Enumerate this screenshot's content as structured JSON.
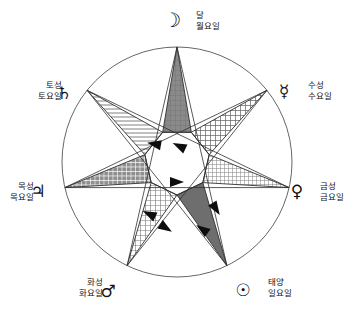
{
  "figure": {
    "center": {
      "x": 177,
      "y": 162
    },
    "outer_radius": 115,
    "inner_radius": 33,
    "circle_color": "#555555",
    "line_color": "#303030",
    "arrow_color": "#0d0d0d"
  },
  "nodes": [
    {
      "id": "moon",
      "symbol": "☽",
      "planet_ko": "달",
      "day_ko": "월요일",
      "angle_deg": -90,
      "label_x": 196,
      "label_y": 18,
      "label_anchor": "start",
      "glyph_x": 172,
      "glyph_y": 27,
      "fill_pattern": "dark-grid",
      "fill_color": "#8a8a8a"
    },
    {
      "id": "mercury",
      "symbol": "☿",
      "planet_ko": "수성",
      "day_ko": "수요일",
      "angle_deg": -38.571,
      "label_x": 308,
      "label_y": 88,
      "label_anchor": "start",
      "glyph_x": 284,
      "glyph_y": 97,
      "fill_pattern": "mid-grid",
      "fill_color": "#bdbdbd"
    },
    {
      "id": "venus",
      "symbol": "♀",
      "planet_ko": "금성",
      "day_ko": "금요일",
      "angle_deg": 12.857,
      "label_x": 320,
      "label_y": 189,
      "label_anchor": "start",
      "glyph_x": 297,
      "glyph_y": 197,
      "fill_pattern": "fine-dot",
      "fill_color": "#d5d5d5"
    },
    {
      "id": "sun",
      "symbol": "☉",
      "planet_ko": "태양",
      "day_ko": "일요일",
      "angle_deg": 64.286,
      "label_x": 268,
      "label_y": 285,
      "label_anchor": "start",
      "glyph_x": 243,
      "glyph_y": 296,
      "fill_pattern": "solid-dark",
      "fill_color": "#6e6e6e"
    },
    {
      "id": "mars",
      "symbol": "♂",
      "planet_ko": "화성",
      "day_ko": "화요일",
      "angle_deg": 115.714,
      "label_x": 103,
      "label_y": 285,
      "label_anchor": "end",
      "glyph_x": 108,
      "glyph_y": 297,
      "fill_pattern": "light-grid",
      "fill_color": "#e0e0e0"
    },
    {
      "id": "jupiter",
      "symbol": "♃",
      "planet_ko": "목성",
      "day_ko": "목요일",
      "angle_deg": 167.143,
      "label_x": 34,
      "label_y": 189,
      "label_anchor": "end",
      "glyph_x": 38,
      "glyph_y": 197,
      "fill_pattern": "dense-grid",
      "fill_color": "#9e9e9e"
    },
    {
      "id": "saturn",
      "symbol": "♄",
      "planet_ko": "토성",
      "day_ko": "토요일",
      "angle_deg": -141.429,
      "label_x": 62,
      "label_y": 88,
      "label_anchor": "end",
      "glyph_x": 64,
      "glyph_y": 99,
      "fill_pattern": "h-lines",
      "fill_color": "#ededed"
    }
  ],
  "arrows": [
    {
      "id": "arrow-moon-to-jupiter",
      "x": 154,
      "y": 144,
      "rot": 190
    },
    {
      "id": "arrow-mercury-to-saturn",
      "x": 179,
      "y": 146,
      "rot": 205
    },
    {
      "id": "arrow-jupiter-to-venus",
      "x": 177,
      "y": 182,
      "rot": 0
    },
    {
      "id": "arrow-mars-to-mercury",
      "x": 149,
      "y": 214,
      "rot": 205
    },
    {
      "id": "arrow-sun-to-mars",
      "x": 166,
      "y": 228,
      "rot": 33
    },
    {
      "id": "arrow-venus-to-sun",
      "x": 216,
      "y": 209,
      "rot": 58
    },
    {
      "id": "arrow-sun-tail",
      "x": 202,
      "y": 229,
      "rot": 215
    }
  ]
}
